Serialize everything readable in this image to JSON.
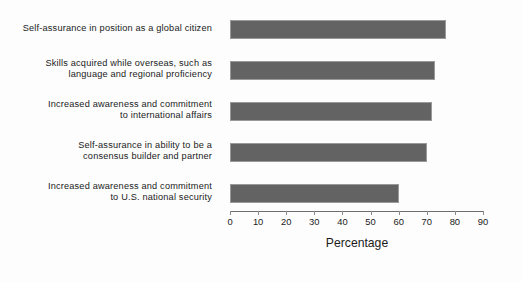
{
  "chart_data": {
    "type": "bar",
    "orientation": "horizontal",
    "title": "",
    "xlabel": "Percentage",
    "ylabel": "",
    "xlim": [
      0,
      90
    ],
    "xticks": [
      0,
      10,
      20,
      30,
      40,
      50,
      60,
      70,
      80,
      90
    ],
    "xtick_labels": [
      "0",
      "10",
      "20",
      "30",
      "40",
      "50",
      "60",
      "70",
      "80",
      "90"
    ],
    "grid": false,
    "legend": false,
    "bar_color": "#636363",
    "bar_edge_color": "#9a9a9a",
    "categories": [
      "Self-assurance in position as a global citizen",
      "Skills acquired while overseas, such as language and regional proficiency",
      "Increased awareness and commitment to international affairs",
      "Self-assurance in ability to be a consensus builder and partner",
      "Increased awareness and commitment to U.S. national security"
    ],
    "category_lines": [
      [
        "Self-assurance in position as a global citizen"
      ],
      [
        "Skills acquired while overseas, such as",
        "language and regional proficiency"
      ],
      [
        "Increased awareness and commitment",
        "to international affairs"
      ],
      [
        "Self-assurance in ability to be a",
        "consensus builder and partner"
      ],
      [
        "Increased awareness and commitment",
        "to U.S. national security"
      ]
    ],
    "values": [
      77,
      73,
      72,
      70,
      60
    ]
  }
}
